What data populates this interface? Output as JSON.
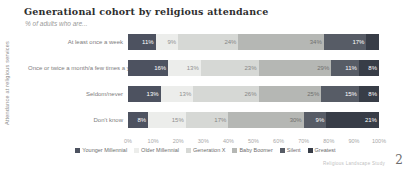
{
  "title": "Generational cohort by religious attendance",
  "subtitle": "% of adults who are...",
  "y_axis_label": "Attendance at religious services",
  "source_note": "Religious Landscape Study",
  "page_number": "2",
  "chart_data": {
    "type": "bar",
    "stacked": true,
    "orientation": "horizontal",
    "title": "Generational cohort by religious attendance",
    "xlabel": "",
    "ylabel": "Attendance at religious services",
    "xlim": [
      0,
      100
    ],
    "grid": false,
    "legend_position": "bottom",
    "categories": [
      "At least once a week",
      "Once or twice a month/a few times a year",
      "Seldom/never",
      "Don't know"
    ],
    "x_ticks": [
      "0%",
      "10%",
      "20%",
      "30%",
      "40%",
      "50%",
      "60%",
      "70%",
      "80%",
      "90%",
      "100%"
    ],
    "series": [
      {
        "name": "Younger Millennial",
        "color": "#4d5260",
        "text_color": "#ffffff",
        "values": [
          11,
          16,
          13,
          8
        ],
        "labels": [
          "11%",
          "16%",
          "13%",
          "8%"
        ]
      },
      {
        "name": "Older Millennial",
        "color": "#ecedeb",
        "text_color": "#909090",
        "values": [
          9,
          13,
          13,
          15
        ],
        "labels": [
          "9%",
          "13%",
          "13%",
          "15%"
        ]
      },
      {
        "name": "Generation X",
        "color": "#d6d8d5",
        "text_color": "#878787",
        "values": [
          24,
          23,
          26,
          17
        ],
        "labels": [
          "24%",
          "23%",
          "26%",
          "17%"
        ]
      },
      {
        "name": "Baby Boomer",
        "color": "#b5b7b4",
        "text_color": "#70706e",
        "values": [
          34,
          29,
          25,
          30
        ],
        "labels": [
          "34%",
          "29%",
          "25%",
          "30%"
        ]
      },
      {
        "name": "Silent",
        "color": "#575c66",
        "text_color": "#ffffff",
        "values": [
          17,
          11,
          15,
          9
        ],
        "labels": [
          "17%",
          "11%",
          "15%",
          "9%"
        ]
      },
      {
        "name": "Greatest",
        "color": "#383d47",
        "text_color": "#ffffff",
        "values": [
          5,
          8,
          8,
          21
        ],
        "labels": [
          "",
          "8%",
          "8%",
          "21%"
        ]
      }
    ]
  }
}
